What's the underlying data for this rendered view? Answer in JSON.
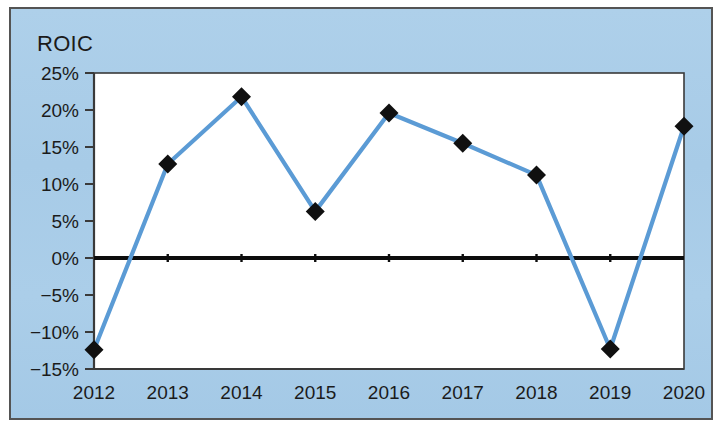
{
  "chart_data": {
    "type": "line",
    "title": "ROIC",
    "xlabel": "",
    "ylabel": "",
    "categories": [
      "2012",
      "2013",
      "2014",
      "2015",
      "2016",
      "2017",
      "2018",
      "2019",
      "2020"
    ],
    "values": [
      -12.4,
      12.7,
      21.8,
      6.3,
      19.6,
      15.5,
      11.2,
      -12.3,
      17.8
    ],
    "series": [
      {
        "name": "ROIC",
        "values": [
          -12.4,
          12.7,
          21.8,
          6.3,
          19.6,
          15.5,
          11.2,
          -12.3,
          17.8
        ]
      }
    ],
    "y_tick_labels": [
      "25%",
      "20%",
      "15%",
      "10%",
      "5%",
      "0%",
      "-5%",
      "-10%",
      "-15%"
    ],
    "y_tick_values": [
      25,
      20,
      15,
      10,
      5,
      0,
      -5,
      -10,
      -15
    ],
    "x_tick_labels": [
      "2012",
      "2013",
      "2014",
      "2015",
      "2016",
      "2017",
      "2018",
      "2019",
      "2020"
    ],
    "ylim": [
      -15,
      25
    ],
    "grid": false,
    "legend": "none",
    "zero_line": true,
    "marker": "diamond",
    "colors": {
      "line": "#5b9bd5",
      "marker": "#101010",
      "panel_background": "#a9cde9",
      "plot_background": "#ffffff",
      "axis": "#3a3a3a",
      "zero_line": "#0d0d0d",
      "text": "#1b1b1b",
      "frame_border": "#545454"
    }
  }
}
